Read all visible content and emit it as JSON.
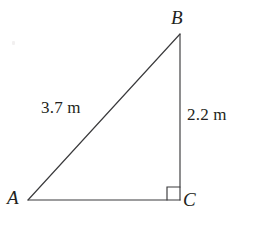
{
  "figure": {
    "type": "geometry-diagram",
    "shape": "right-triangle",
    "background_color": "#ffffff",
    "stroke_color": "#3a3a3c",
    "text_color": "#231f20",
    "vertices": {
      "a": {
        "label": "A",
        "x": 28,
        "y": 200
      },
      "b": {
        "label": "B",
        "x": 180,
        "y": 34
      },
      "c": {
        "label": "C",
        "x": 180,
        "y": 200
      }
    },
    "sides": {
      "hypotenuse_ab": {
        "label": "3.7 m",
        "value": 3.7,
        "unit": "m"
      },
      "vertical_bc": {
        "label": "2.2 m",
        "value": 2.2,
        "unit": "m"
      },
      "base_ac": {
        "label": "",
        "value": null,
        "unit": "m"
      }
    },
    "right_angle": {
      "at_vertex": "C",
      "marker": "square",
      "size": 13
    }
  }
}
